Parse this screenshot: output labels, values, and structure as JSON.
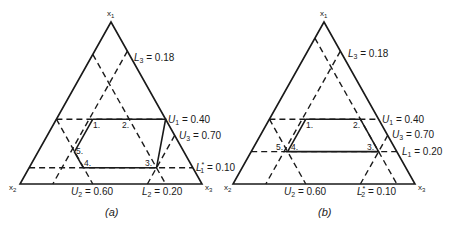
{
  "figure": {
    "panels": [
      {
        "id": "a",
        "caption": "(a)",
        "vertices": {
          "top": "x1",
          "left": "x2",
          "right": "x3"
        },
        "constraints": [
          {
            "label": "L3 = 0.18",
            "var": "x3",
            "type": "lower",
            "value": 0.18,
            "style": "dashed"
          },
          {
            "label": "U1 = 0.40",
            "var": "x1",
            "type": "upper",
            "value": 0.4,
            "style": "dashed"
          },
          {
            "label": "U3 = 0.70",
            "var": "x3",
            "type": "upper",
            "value": 0.7,
            "style": "dashed"
          },
          {
            "label": "L1* = 0.10",
            "var": "x1",
            "type": "lower",
            "value": 0.1,
            "style": "dashed"
          },
          {
            "label": "U2 = 0.60",
            "var": "x2",
            "type": "upper",
            "value": 0.6,
            "style": "dashed"
          },
          {
            "label": "L2 = 0.20",
            "var": "x2",
            "type": "lower",
            "value": 0.2,
            "style": "dashed"
          }
        ],
        "points": [
          "1.",
          "2.",
          "3.",
          "4.",
          "5."
        ]
      },
      {
        "id": "b",
        "caption": "(b)",
        "vertices": {
          "top": "x1",
          "left": "x2",
          "right": "x3"
        },
        "constraints": [
          {
            "label": "L3 = 0.18",
            "var": "x3",
            "type": "lower",
            "value": 0.18,
            "style": "dashed"
          },
          {
            "label": "U1 = 0.40",
            "var": "x1",
            "type": "upper",
            "value": 0.4,
            "style": "dashed"
          },
          {
            "label": "U3 = 0.70",
            "var": "x3",
            "type": "upper",
            "value": 0.7,
            "style": "dashed"
          },
          {
            "label": "L1 = 0.20",
            "var": "x1",
            "type": "lower",
            "value": 0.2,
            "style": "dashed"
          },
          {
            "label": "U2 = 0.60",
            "var": "x2",
            "type": "upper",
            "value": 0.6,
            "style": "dashed"
          },
          {
            "label": "L2* = 0.10",
            "var": "x2",
            "type": "lower",
            "value": 0.1,
            "style": "dashed"
          }
        ],
        "points": [
          "1.",
          "2.",
          "3.",
          "4.",
          "5."
        ]
      }
    ]
  },
  "text": {
    "a": {
      "x1": "x",
      "x1_sub": "1",
      "x2": "x",
      "x2_sub": "2",
      "x3": "x",
      "x3_sub": "3",
      "L3_sym": "L",
      "L3_sub": "3",
      "L3_val": " = 0.18",
      "U1_sym": "U",
      "U1_sub": "1",
      "U1_val": " = 0.40",
      "U3_sym": "U",
      "U3_sub": "3",
      "U3_val": " = 0.70",
      "L1_sym": "L",
      "L1_sub": "1",
      "L1_sup": "*",
      "L1_val": " = 0.10",
      "U2_sym": "U",
      "U2_sub": "2",
      "U2_val": " = 0.60",
      "L2_sym": "L",
      "L2_sub": "2",
      "L2_val": " = 0.20",
      "p1": "1.",
      "p2": "2.",
      "p3": "3.",
      "p4": "4.",
      "p5": "5.",
      "caption": "(a)"
    },
    "b": {
      "x1": "x",
      "x1_sub": "1",
      "x2": "x",
      "x2_sub": "2",
      "x3": "x",
      "x3_sub": "3",
      "L3_sym": "L",
      "L3_sub": "3",
      "L3_val": " = 0.18",
      "U1_sym": "U",
      "U1_sub": "1",
      "U1_val": " = 0.40",
      "U3_sym": "U",
      "U3_sub": "3",
      "U3_val": " = 0.70",
      "L1_sym": "L",
      "L1_sub": "1",
      "L1_val": " = 0.20",
      "U2_sym": "U",
      "U2_sub": "2",
      "U2_val": " = 0.60",
      "L2_sym": "L",
      "L2_sub": "2",
      "L2_sup": "*",
      "L2_val": " = 0.10",
      "p1": "1.",
      "p2": "2.",
      "p3": "3.",
      "p4": "4.",
      "p5": "5.",
      "caption": "(b)"
    }
  }
}
